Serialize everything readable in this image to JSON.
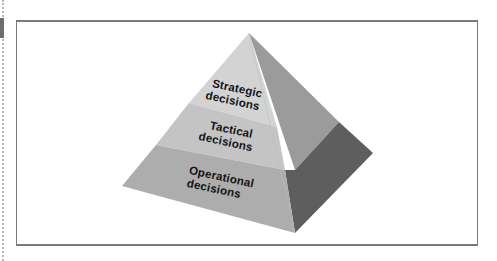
{
  "diagram": {
    "type": "pyramid",
    "levels": [
      {
        "name": "Strategic",
        "line1": "Strategic",
        "line2": "decisions"
      },
      {
        "name": "Tactical",
        "line1": "Tactical",
        "line2": "decisions"
      },
      {
        "name": "Operational",
        "line1": "Operational",
        "line2": "decisions"
      }
    ],
    "colors": {
      "left_face_top": "#d2d2d2",
      "left_face_middle": "#c3c3c3",
      "left_face_bottom": "#aeaeae",
      "right_face_light": "#9b9b9b",
      "right_face_dark": "#5e5e5e",
      "frame": "#7a7a7a"
    }
  }
}
